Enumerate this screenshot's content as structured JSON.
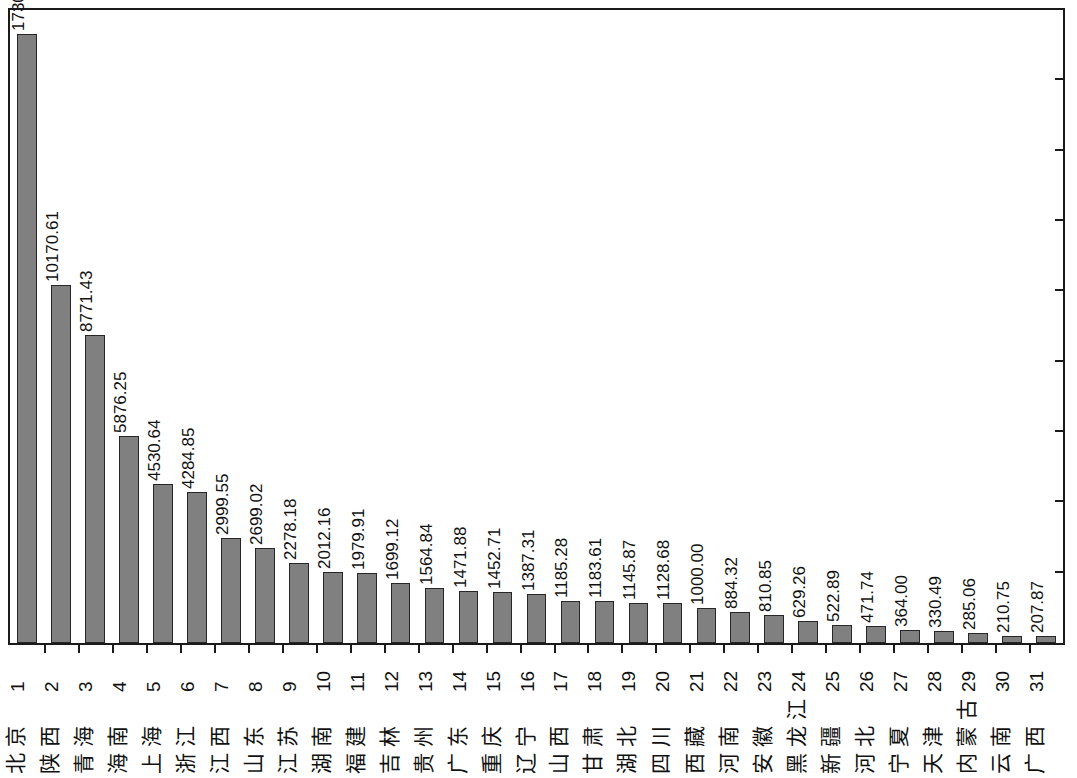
{
  "chart_data": {
    "type": "bar",
    "title": "",
    "subtitle": "",
    "xlabel": "",
    "ylabel": "",
    "ylim": [
      0,
      18000
    ],
    "grid": false,
    "legend": null,
    "axis_ticks_right": [
      0,
      2000,
      4000,
      6000,
      8000,
      10000,
      12000,
      14000,
      16000,
      18000
    ],
    "categories": [
      "北京",
      "陕西",
      "青海",
      "海南",
      "上海",
      "浙江",
      "江西",
      "山东",
      "江苏",
      "湖南",
      "福建",
      "吉林",
      "贵州",
      "广东",
      "重庆",
      "辽宁",
      "山西",
      "甘肃",
      "湖北",
      "四川",
      "西藏",
      "河南",
      "安徽",
      "黑龙江",
      "新疆",
      "河北",
      "宁夏",
      "天津",
      "内蒙古",
      "云南",
      "广西"
    ],
    "index_labels": [
      "1",
      "2",
      "3",
      "4",
      "5",
      "6",
      "7",
      "8",
      "9",
      "10",
      "11",
      "12",
      "13",
      "14",
      "15",
      "16",
      "17",
      "18",
      "19",
      "20",
      "21",
      "22",
      "23",
      "24",
      "25",
      "26",
      "27",
      "28",
      "29",
      "30",
      "31"
    ],
    "values": [
      17308.09,
      10170.61,
      8771.43,
      5876.25,
      4530.64,
      4284.85,
      2999.55,
      2699.02,
      2278.18,
      2012.16,
      1979.91,
      1699.12,
      1564.84,
      1471.88,
      1452.71,
      1387.31,
      1185.28,
      1183.61,
      1145.87,
      1128.68,
      1000.0,
      884.32,
      810.85,
      629.26,
      522.89,
      471.74,
      364.0,
      330.49,
      285.06,
      210.75,
      207.87
    ],
    "value_labels": [
      "17308.09",
      "10170.61",
      "8771.43",
      "5876.25",
      "4530.64",
      "4284.85",
      "2999.55",
      "2699.02",
      "2278.18",
      "2012.16",
      "1979.91",
      "1699.12",
      "1564.84",
      "1471.88",
      "1452.71",
      "1387.31",
      "1185.28",
      "1183.61",
      "1145.87",
      "1128.68",
      "1000.00",
      "884.32",
      "810.85",
      "629.26",
      "522.89",
      "471.74",
      "364.00",
      "330.49",
      "285.06",
      "210.75",
      "207.87"
    ],
    "colors": {
      "bar_fill": "#808080",
      "bar_stroke": "#262626",
      "axis": "#1a1a1a",
      "text": "#111111",
      "background": "#ffffff"
    }
  }
}
